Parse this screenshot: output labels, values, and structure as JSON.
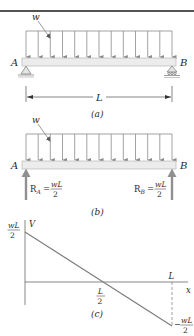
{
  "figure": {
    "panel_a": {
      "load_label": "w",
      "left_label": "A",
      "right_label": "B",
      "span_label": "L",
      "caption": "(a)"
    },
    "panel_b": {
      "load_label": "w",
      "left_label": "A",
      "right_label": "B",
      "reaction_a": {
        "symbol": "R",
        "subscript": "A",
        "eq": "=",
        "num": "wL",
        "den": "2"
      },
      "reaction_b": {
        "symbol": "R",
        "subscript": "B",
        "eq": "=",
        "num": "wL",
        "den": "2"
      },
      "caption": "(b)"
    },
    "panel_c": {
      "y_axis_label": "V",
      "x_axis_label": "x",
      "max_num": "wL",
      "max_den": "2",
      "mid_num": "L",
      "mid_den": "2",
      "end_label": "L",
      "min_sign": "−",
      "min_num": "wL",
      "min_den": "2",
      "caption": "(c)"
    }
  },
  "colors": {
    "rule": "#1a1a1a",
    "beam_fill": "#ececec",
    "beam_stroke": "#b8b8b8",
    "load": "#8a8a8a",
    "reaction": "#909090",
    "plot_line": "#7a7a7a",
    "text": "#2a2a2a"
  }
}
